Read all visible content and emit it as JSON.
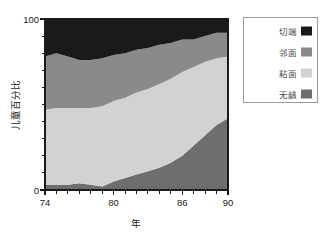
{
  "chart_data": {
    "type": "area",
    "stacked": true,
    "title": "",
    "xlabel": "年",
    "ylabel": "儿童百分比",
    "xlim": [
      74,
      90
    ],
    "ylim": [
      0,
      100
    ],
    "grid": false,
    "legend_position": "top-right",
    "x": [
      74,
      75,
      76,
      77,
      78,
      79,
      80,
      81,
      82,
      83,
      84,
      85,
      86,
      87,
      88,
      89,
      90
    ],
    "xticks": [
      74,
      80,
      86,
      90
    ],
    "xticklabels": [
      "74",
      "80",
      "86",
      "90"
    ],
    "xminorticks": [
      75,
      76,
      77,
      78,
      79,
      81,
      82,
      83,
      84,
      85,
      87,
      88,
      89
    ],
    "yticks": [
      0,
      100
    ],
    "yticklabels": [
      "0",
      "100"
    ],
    "yminorticks": [
      10,
      20,
      30,
      40,
      50,
      60,
      70,
      80,
      90
    ],
    "series": [
      {
        "name": "无龋",
        "color": "#6e6e6e",
        "stack_order": 1,
        "values": [
          3,
          3,
          3,
          4,
          3,
          2,
          5,
          7,
          9,
          11,
          13,
          16,
          20,
          26,
          32,
          38,
          42
        ]
      },
      {
        "name": "粘面",
        "color": "#d2d2d2",
        "stack_order": 2,
        "values": [
          44,
          45,
          45,
          44,
          45,
          47,
          47,
          47,
          48,
          48,
          49,
          49,
          49,
          46,
          43,
          39,
          36
        ]
      },
      {
        "name": "邻面",
        "color": "#8a8a8a",
        "stack_order": 3,
        "values": [
          31,
          32,
          30,
          28,
          28,
          28,
          27,
          26,
          25,
          24,
          23,
          21,
          19,
          16,
          15,
          15,
          14
        ]
      },
      {
        "name": "切端",
        "color": "#1a1a1a",
        "stack_order": 4,
        "values": [
          22,
          20,
          22,
          24,
          24,
          23,
          21,
          20,
          18,
          17,
          15,
          14,
          12,
          12,
          10,
          8,
          8
        ]
      }
    ],
    "cumulative_boundaries": {
      "note": "cumulative top edge of each band, percent",
      "band1_top": [
        3,
        3,
        3,
        4,
        3,
        2,
        5,
        7,
        9,
        11,
        13,
        16,
        20,
        26,
        32,
        38,
        42
      ],
      "band2_top": [
        47,
        48,
        48,
        48,
        48,
        49,
        52,
        54,
        57,
        59,
        62,
        65,
        69,
        72,
        75,
        77,
        78
      ],
      "band3_top": [
        78,
        80,
        78,
        76,
        76,
        77,
        79,
        80,
        82,
        83,
        85,
        86,
        88,
        88,
        90,
        92,
        92
      ],
      "band4_top": [
        100,
        100,
        100,
        100,
        100,
        100,
        100,
        100,
        100,
        100,
        100,
        100,
        100,
        100,
        100,
        100,
        100
      ]
    }
  },
  "legend": {
    "items": [
      {
        "label": "切端",
        "color": "#1a1a1a"
      },
      {
        "label": "邻面",
        "color": "#8a8a8a"
      },
      {
        "label": "粘面",
        "color": "#d2d2d2"
      },
      {
        "label": "无龋",
        "color": "#6e6e6e"
      }
    ]
  },
  "axes": {
    "y_title": "儿童百分比",
    "x_title": "年",
    "y_top_label": "100",
    "y_bottom_label": "0",
    "x_labels": [
      "74",
      "80",
      "86",
      "90"
    ]
  }
}
